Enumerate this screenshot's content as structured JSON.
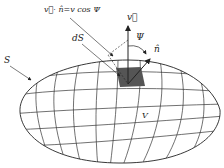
{
  "figure": {
    "type": "flux through closed surface",
    "labels": {
      "equation": "v⃗· n̂=v cos Ψ",
      "dS": "dS",
      "S": "S",
      "V": "V",
      "v": "v⃗",
      "n": "n̂",
      "psi": "Ψ"
    },
    "colors": {
      "line": "#333333",
      "patch": "#555555",
      "background": "#ffffff"
    }
  }
}
